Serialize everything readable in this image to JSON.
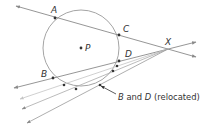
{
  "diagram": {
    "type": "geometry",
    "colors": {
      "line": "#8a8a8a",
      "faint_line": "#c4c4c4",
      "circle": "#9a9a9a",
      "point": "#333333",
      "text": "#333333"
    },
    "circle": {
      "center_label": "P",
      "cx": 81,
      "cy": 48,
      "r": 38
    },
    "points": [
      {
        "label": "A",
        "x": 55,
        "y": 18
      },
      {
        "label": "C",
        "x": 119,
        "y": 35
      },
      {
        "label": "D",
        "x": 119,
        "y": 61
      },
      {
        "label": "B",
        "x": 53,
        "y": 78
      },
      {
        "label": "X",
        "x": 168,
        "y": 49
      }
    ],
    "relocated_points": [
      {
        "x": 64,
        "y": 85
      },
      {
        "x": 76,
        "y": 89
      },
      {
        "x": 100,
        "y": 85
      },
      {
        "x": 113,
        "y": 71
      },
      {
        "x": 117,
        "y": 66
      }
    ],
    "labels": {
      "A": "A",
      "C": "C",
      "D": "D",
      "B": "B",
      "X": "X",
      "P": "P",
      "annotation_b": "B",
      "annotation_and": " and ",
      "annotation_d": "D",
      "annotation_rest": " (relocated)"
    }
  }
}
